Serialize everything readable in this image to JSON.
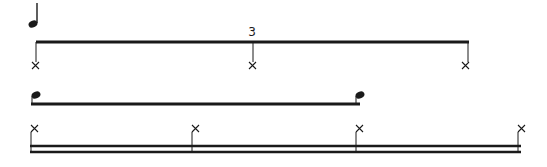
{
  "diagram": {
    "colors": {
      "ink": "#1a1a1a",
      "background": "#ffffff"
    },
    "rows": [
      {
        "id": "quarter-note-legend",
        "glyph": "quarter-note",
        "x": 33,
        "y": 24
      },
      {
        "id": "triplet-row",
        "tuplet_label": "3",
        "bracket_y": 42,
        "x_start": 36,
        "x_end": 468,
        "notes_x": [
          36,
          252,
          468
        ],
        "notehead": "x"
      },
      {
        "id": "eighth-row",
        "beam_y": 104,
        "notes_x": [
          36,
          360
        ],
        "notehead": "filled"
      },
      {
        "id": "sixteenth-row",
        "beam_y": [
          146,
          152
        ],
        "notes_x": [
          33,
          193,
          357,
          520
        ],
        "notehead": "x"
      }
    ]
  }
}
